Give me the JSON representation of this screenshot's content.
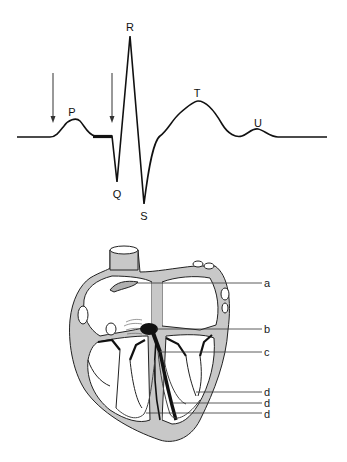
{
  "ecg": {
    "labels": {
      "P": "P",
      "Q": "Q",
      "R": "R",
      "S": "S",
      "T": "T",
      "U": "U"
    },
    "arrows": [
      {
        "id": "arrow-before-p-wave"
      },
      {
        "id": "arrow-before-qrs"
      }
    ],
    "highlighted_segment": "PR segment (bold)"
  },
  "heart": {
    "labels": {
      "a": "a",
      "b": "b",
      "c": "c",
      "d1": "d",
      "d2": "d",
      "d3": "d"
    }
  },
  "colors": {
    "line": "#111111",
    "heart_wall": "#c8c8c8",
    "conduction": "#1a1a1a",
    "background": "#ffffff"
  }
}
